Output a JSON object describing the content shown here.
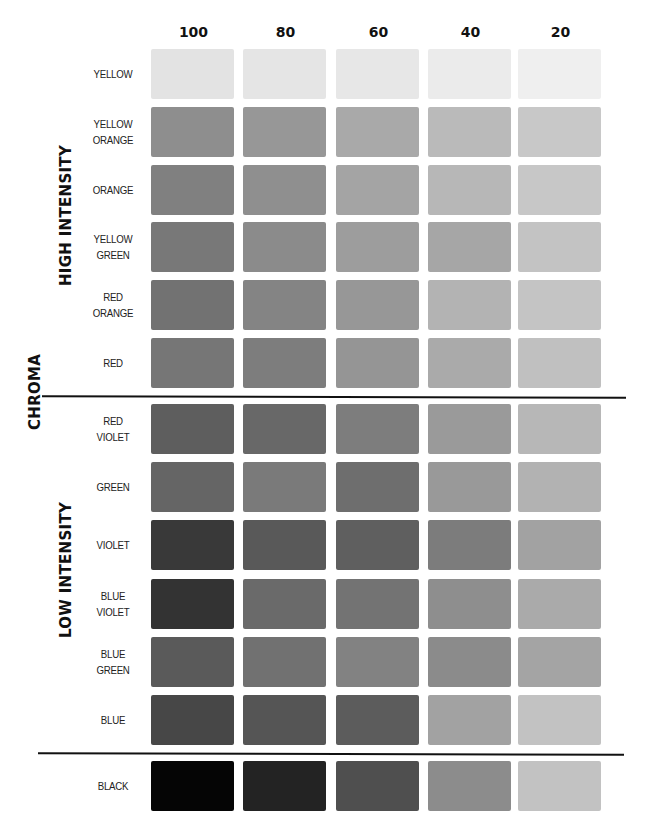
{
  "chart_data": {
    "type": "heatmap",
    "title": "",
    "axis_label_left": "CHROMA",
    "column_axis": "value/percent",
    "columns": [
      "100",
      "80",
      "60",
      "40",
      "20"
    ],
    "groups": [
      {
        "name": "HIGH INTENSITY",
        "rows": [
          {
            "label": "YELLOW",
            "colors": [
              "#e3e3e3",
              "#e5e5e5",
              "#e7e7e7",
              "#ebebeb",
              "#efefef"
            ]
          },
          {
            "label": "YELLOW ORANGE",
            "colors": [
              "#8e8e8e",
              "#979797",
              "#a9a9a9",
              "#bababa",
              "#c8c8c8"
            ]
          },
          {
            "label": "ORANGE",
            "colors": [
              "#808080",
              "#8f8f8f",
              "#a4a4a4",
              "#b7b7b7",
              "#c7c7c7"
            ]
          },
          {
            "label": "YELLOW GREEN",
            "colors": [
              "#787878",
              "#8b8b8b",
              "#9d9d9d",
              "#a6a6a6",
              "#c3c3c3"
            ]
          },
          {
            "label": "RED ORANGE",
            "colors": [
              "#727272",
              "#848484",
              "#979797",
              "#b3b3b3",
              "#c4c4c4"
            ]
          },
          {
            "label": "RED",
            "colors": [
              "#767676",
              "#7d7d7d",
              "#959595",
              "#aaaaaa",
              "#c0c0c0"
            ]
          }
        ]
      },
      {
        "name": "LOW INTENSITY",
        "rows": [
          {
            "label": "RED VIOLET",
            "colors": [
              "#5e5e5e",
              "#686868",
              "#7d7d7d",
              "#9a9a9a",
              "#b7b7b7"
            ]
          },
          {
            "label": "GREEN",
            "colors": [
              "#656565",
              "#7a7a7a",
              "#6e6e6e",
              "#999999",
              "#b2b2b2"
            ]
          },
          {
            "label": "VIOLET",
            "colors": [
              "#393939",
              "#595959",
              "#5f5f5f",
              "#7c7c7c",
              "#a2a2a2"
            ]
          },
          {
            "label": "BLUE VIOLET",
            "colors": [
              "#333333",
              "#6a6a6a",
              "#737373",
              "#8e8e8e",
              "#aaaaaa"
            ]
          },
          {
            "label": "BLUE GREEN",
            "colors": [
              "#5a5a5a",
              "#717171",
              "#828282",
              "#8b8b8b",
              "#a4a4a4"
            ]
          },
          {
            "label": "BLUE",
            "colors": [
              "#474747",
              "#555555",
              "#5c5c5c",
              "#a2a2a2",
              "#c2c2c2"
            ]
          }
        ]
      },
      {
        "name": "",
        "rows": [
          {
            "label": "BLACK",
            "colors": [
              "#050505",
              "#232323",
              "#4f4f4f",
              "#8c8c8c",
              "#c2c2c2"
            ]
          }
        ]
      }
    ]
  },
  "header": {
    "columns": [
      "100",
      "80",
      "60",
      "40",
      "20"
    ]
  },
  "side_labels": {
    "high": "HIGH INTENSITY",
    "low": "LOW INTENSITY",
    "chroma": "CHROMA"
  },
  "rows": [
    {
      "label": "YELLOW"
    },
    {
      "label": "YELLOW\nORANGE"
    },
    {
      "label": "ORANGE"
    },
    {
      "label": "YELLOW\nGREEN"
    },
    {
      "label": "RED\nORANGE"
    },
    {
      "label": "RED"
    },
    {
      "label": "RED\nVIOLET"
    },
    {
      "label": "GREEN"
    },
    {
      "label": "VIOLET"
    },
    {
      "label": "BLUE\nVIOLET"
    },
    {
      "label": "BLUE\nGREEN"
    },
    {
      "label": "BLUE"
    },
    {
      "label": "BLACK"
    }
  ]
}
